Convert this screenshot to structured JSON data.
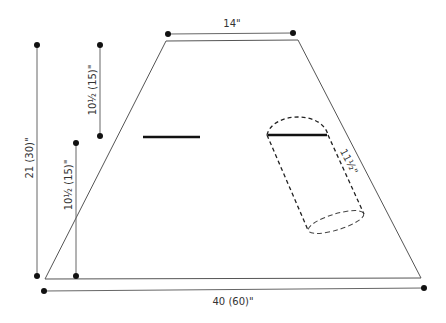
{
  "diagram": {
    "type": "schematic",
    "colors": {
      "outline": "#555555",
      "dimension_line": "#666666",
      "bar": "#111111",
      "dot": "#111111",
      "text": "#333333"
    },
    "labels": {
      "top_width": "14\"",
      "bottom_width": "40 (60)\"",
      "total_height": "21 (30)\"",
      "upper_segment": "10½ (15)\"",
      "lower_segment": "10½ (15)\"",
      "sleeve_length": "11½\""
    },
    "shapes": {
      "trapezoid": {
        "points": [
          [
            166,
            41
          ],
          [
            298,
            40
          ],
          [
            421,
            278
          ],
          [
            45,
            279
          ]
        ]
      },
      "left_bar": {
        "x1": 143,
        "y1": 137,
        "x2": 200,
        "y2": 137
      },
      "sleeve_top_bar": {
        "x1": 268,
        "y1": 135,
        "x2": 327,
        "y2": 135
      }
    }
  }
}
